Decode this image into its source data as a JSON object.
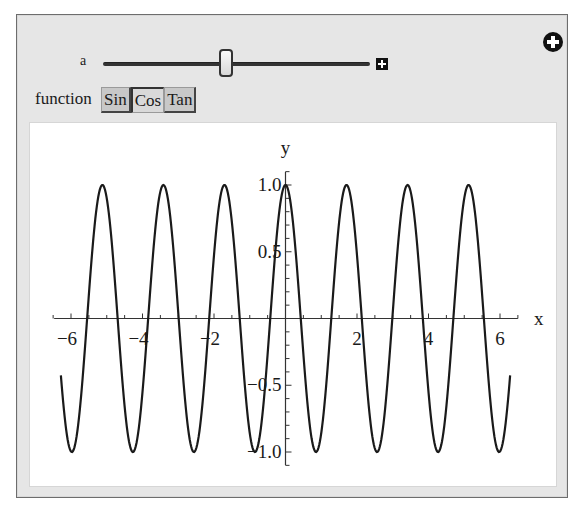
{
  "controls": {
    "slider": {
      "label": "a",
      "value": 3.68,
      "min": 0,
      "max": 8
    },
    "function_label": "function",
    "function_options": [
      "Sin",
      "Cos",
      "Tan"
    ],
    "selected_function": "Cos",
    "add_icon": "plus-circle-icon",
    "expand_icon": "plus-square-icon"
  },
  "chart_data": {
    "type": "line",
    "title": "",
    "function": "cos(a x)",
    "parameter_a": 3.68,
    "xlabel": "x",
    "ylabel": "y",
    "xlim": [
      -6.5,
      6.5
    ],
    "ylim": [
      -1.1,
      1.1
    ],
    "domain": [
      -6.283,
      6.283
    ],
    "x_ticks": [
      -6,
      -4,
      -2,
      2,
      4,
      6
    ],
    "x_tick_labels": [
      "−6",
      "−4",
      "−2",
      "2",
      "4",
      "6"
    ],
    "x_minor_step": 0.5,
    "y_ticks": [
      1.0,
      0.5,
      -0.5,
      -1.0
    ],
    "y_tick_labels": [
      "1.0",
      "0.5",
      "−0.5",
      "−1.0"
    ],
    "y_minor_step": 0.1,
    "grid": false,
    "series": [
      {
        "name": "cos(a x)",
        "color": "#1a1a1a",
        "samples": 600
      }
    ]
  }
}
